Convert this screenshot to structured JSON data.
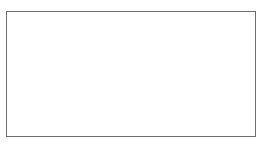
{
  "diagram": {
    "nodes": [
      {
        "id": "S1",
        "base": "S",
        "sub": "1",
        "x": 29,
        "y": 31
      },
      {
        "id": "S5",
        "base": "S",
        "sub": "5",
        "x": 83,
        "y": 31
      },
      {
        "id": "S8",
        "base": "S",
        "sub": "8",
        "x": 137,
        "y": 31
      },
      {
        "id": "S11",
        "base": "S",
        "sub": "11",
        "x": 197,
        "y": 31
      },
      {
        "id": "S2",
        "base": "S",
        "sub": "2",
        "x": 29,
        "y": 74
      },
      {
        "id": "S6",
        "base": "S",
        "sub": "6",
        "x": 83,
        "y": 74
      },
      {
        "id": "S3",
        "base": "S",
        "sub": "3",
        "x": 29,
        "y": 117
      },
      {
        "id": "S7",
        "base": "S",
        "sub": "7",
        "x": 83,
        "y": 117
      },
      {
        "id": "S10",
        "base": "S",
        "sub": "10",
        "x": 137,
        "y": 117
      },
      {
        "id": "S12",
        "base": "S",
        "sub": "12",
        "x": 197,
        "y": 117
      }
    ],
    "edges": [
      {
        "from": "S1",
        "to": "S5",
        "base": "a",
        "sub": "1,5"
      },
      {
        "from": "S5",
        "to": "S8",
        "base": "a",
        "sub": "5,8"
      },
      {
        "from": "S8",
        "to": "S11",
        "base": "a",
        "sub": "8,11"
      },
      {
        "from": "S2",
        "to": "S6",
        "base": "a",
        "sub": "2,6"
      },
      {
        "from": "S6",
        "to": "S8",
        "base": "a",
        "sub": "6,8"
      },
      {
        "from": "S6",
        "to": "S10",
        "base": "a",
        "sub": "6,10"
      },
      {
        "from": "S3",
        "to": "S7",
        "base": "a",
        "sub": "3,7"
      },
      {
        "from": "S7",
        "to": "S10",
        "base": "a",
        "sub": "7,10"
      },
      {
        "from": "S10",
        "to": "S12",
        "base": "a",
        "sub": "10,12"
      }
    ],
    "outputs": [
      {
        "from": "S11",
        "base": "x",
        "sub": "1"
      },
      {
        "from": "S12",
        "base": "x",
        "sub": "2"
      }
    ],
    "equation": {
      "lhs": [
        {
          "base": "r",
          "sub": "1"
        },
        {
          "base": "r",
          "sub": "2"
        },
        {
          "base": "r",
          "sub": "3"
        }
      ],
      "equals": "=",
      "matrix": [
        [
          {
            "base": "a",
            "sup": "*",
            "sub": "11"
          },
          {
            "base": "a",
            "sup": "*",
            "sub": "12"
          }
        ],
        [
          {
            "base": "a",
            "sup": "*",
            "sub": "21"
          },
          {
            "base": "a",
            "sup": "*",
            "sub": "22"
          }
        ],
        [
          {
            "base": "a",
            "sup": "*",
            "sub": "31"
          },
          {
            "base": "a",
            "sup": "*",
            "sub": "32"
          }
        ]
      ],
      "rhs": [
        {
          "base": "x",
          "sub": "1"
        },
        {
          "base": "x",
          "sub": "2"
        }
      ]
    }
  }
}
